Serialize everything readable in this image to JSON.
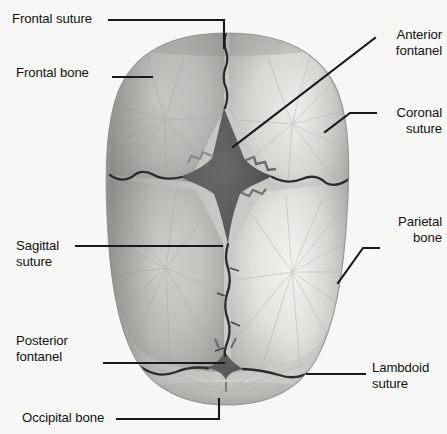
{
  "figure": {
    "background_color": "#f7f7f5",
    "leader_line_color": "#1a1a1a",
    "label_text_color": "#121212"
  },
  "colors": {
    "bone_light": "#f0f0ee",
    "bone_mid": "#c9c9c6",
    "bone_shadow": "#9a9a98",
    "bone_edge": "#8a8a88",
    "fontanel_dark": "#4a4a4a",
    "fontanel_mid": "#5e5e5e",
    "suture_line": "#2b2b2b"
  },
  "labels": [
    {
      "id": "frontal-suture",
      "text": "Frontal suture",
      "side": "left",
      "x": 12,
      "y": 11
    },
    {
      "id": "frontal-bone",
      "text": "Frontal bone",
      "side": "left",
      "x": 16,
      "y": 65
    },
    {
      "id": "anterior-fontanel",
      "text": "Anterior\nfontanel",
      "side": "right",
      "x": 382,
      "y": 27
    },
    {
      "id": "coronal-suture",
      "text": "Coronal\nsuture",
      "side": "right",
      "x": 384,
      "y": 105
    },
    {
      "id": "parietal-bone",
      "text": "Parietal\nbone",
      "side": "right",
      "x": 386,
      "y": 214
    },
    {
      "id": "sagittal-suture",
      "text": "Sagittal\nsuture",
      "side": "left",
      "x": 16,
      "y": 238
    },
    {
      "id": "posterior-fontanel",
      "text": "Posterior\nfontanel",
      "side": "left",
      "x": 16,
      "y": 333
    },
    {
      "id": "lambdoid-suture",
      "text": "Lambdoid\nsuture",
      "side": "right",
      "x": 372,
      "y": 360
    },
    {
      "id": "occipital-bone",
      "text": "Occipital bone",
      "side": "left",
      "x": 22,
      "y": 410
    }
  ],
  "anatomy": {
    "structures": [
      "frontal bone left",
      "frontal bone right",
      "parietal bone left",
      "parietal bone right",
      "occipital bone",
      "anterior fontanel",
      "posterior fontanel",
      "frontal suture",
      "coronal suture",
      "sagittal suture",
      "lambdoid suture"
    ]
  }
}
